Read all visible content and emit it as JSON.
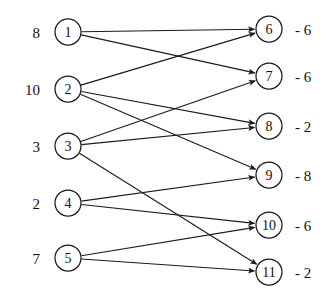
{
  "diagram": {
    "type": "bipartite-directed-graph",
    "colors": {
      "stroke": "#1a1a1a",
      "node_fill": "#ffffff",
      "text": "#111111",
      "background": "#ffffff"
    },
    "left_nodes": [
      {
        "id": "1",
        "label": "1",
        "value": "8",
        "cx": 68,
        "cy": 32
      },
      {
        "id": "2",
        "label": "2",
        "value": "10",
        "cx": 68,
        "cy": 89
      },
      {
        "id": "3",
        "label": "3",
        "value": "3",
        "cx": 68,
        "cy": 146
      },
      {
        "id": "4",
        "label": "4",
        "value": "2",
        "cx": 68,
        "cy": 203
      },
      {
        "id": "5",
        "label": "5",
        "value": "7",
        "cx": 68,
        "cy": 258
      }
    ],
    "right_nodes": [
      {
        "id": "6",
        "label": "6",
        "value": "- 6",
        "cx": 269,
        "cy": 29
      },
      {
        "id": "7",
        "label": "7",
        "value": "- 6",
        "cx": 269,
        "cy": 76
      },
      {
        "id": "8",
        "label": "8",
        "value": "- 2",
        "cx": 269,
        "cy": 126
      },
      {
        "id": "9",
        "label": "9",
        "value": "- 8",
        "cx": 269,
        "cy": 175
      },
      {
        "id": "10",
        "label": "10",
        "value": "- 6",
        "cx": 269,
        "cy": 225
      },
      {
        "id": "11",
        "label": "11",
        "value": "- 2",
        "cx": 269,
        "cy": 272
      }
    ],
    "edges": [
      {
        "from": "1",
        "to": "6"
      },
      {
        "from": "1",
        "to": "7"
      },
      {
        "from": "2",
        "to": "6"
      },
      {
        "from": "2",
        "to": "8"
      },
      {
        "from": "2",
        "to": "9"
      },
      {
        "from": "3",
        "to": "7"
      },
      {
        "from": "3",
        "to": "8"
      },
      {
        "from": "3",
        "to": "11"
      },
      {
        "from": "4",
        "to": "9"
      },
      {
        "from": "4",
        "to": "10"
      },
      {
        "from": "5",
        "to": "10"
      },
      {
        "from": "5",
        "to": "11"
      }
    ],
    "geometry": {
      "node_radius": 13,
      "left_label_x": 40,
      "right_label_x": 295
    }
  }
}
